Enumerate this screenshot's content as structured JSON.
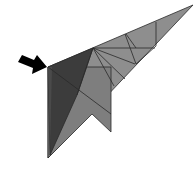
{
  "diagram": {
    "kind": "origami-fold-step",
    "colors": {
      "background": "#ffffff",
      "paper_light": "#8c8c8c",
      "paper_mid": "#7a7a7a",
      "paper_dark": "#3a3a3a",
      "crease": "#2a2a2a",
      "arrow": "#000000"
    },
    "arrow": {
      "icon": "push-arrow-icon",
      "direction": "right-down"
    }
  }
}
